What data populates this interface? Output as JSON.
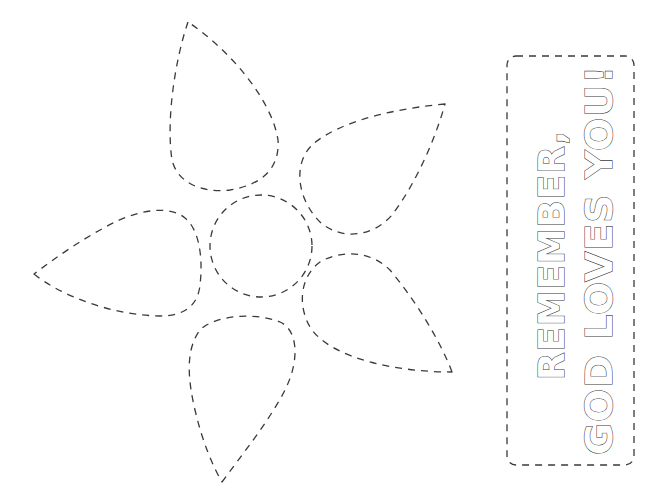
{
  "printable": {
    "type": "cut-out craft template",
    "line_color": "#3a3a3a",
    "background": "#ffffff"
  },
  "flower": {
    "center_icon": "circle-dashed",
    "petal_icon": "teardrop-dashed",
    "petal_count": 5
  },
  "message_box": {
    "lines": [
      "REMEMBER,",
      "GOD LOVES YOU!"
    ],
    "orientation": "rotated -90deg (reads bottom to top)",
    "text_style": "outlined bubble letters"
  }
}
